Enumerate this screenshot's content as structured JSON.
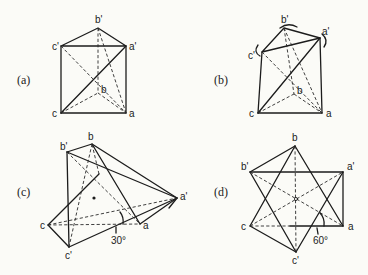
{
  "figure": {
    "panels": [
      {
        "id": "a",
        "label": "(a)",
        "vertex_labels": {
          "a": "a",
          "b": "b",
          "c": "c",
          "a_prime": "a'",
          "b_prime": "b'",
          "c_prime": "c'"
        }
      },
      {
        "id": "b",
        "label": "(b)",
        "vertex_labels": {
          "a": "a",
          "b": "b",
          "c": "c",
          "a_prime": "a'",
          "b_prime": "b'",
          "c_prime": "c'"
        }
      },
      {
        "id": "c",
        "label": "(c)",
        "vertex_labels": {
          "a": "a",
          "b": "b",
          "c": "c",
          "a_prime": "a'",
          "b_prime": "b'",
          "c_prime": "c'"
        },
        "angle_label": "30°"
      },
      {
        "id": "d",
        "label": "(d)",
        "vertex_labels": {
          "a": "a",
          "b": "b",
          "c": "c",
          "a_prime": "a'",
          "b_prime": "b'",
          "c_prime": "c'"
        },
        "angle_label": "60°"
      }
    ],
    "colors": {
      "ink": "#1c1c1c",
      "paper": "#fbfbf7"
    }
  }
}
